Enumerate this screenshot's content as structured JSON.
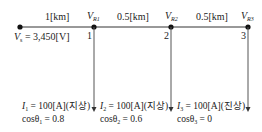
{
  "segments": [
    {
      "label": "1[km]"
    },
    {
      "label": "0.5[km]"
    },
    {
      "label": "0.5[km]"
    }
  ],
  "source": {
    "label_symbol": "V",
    "label_sub": "s",
    "label_value": " = 3,450[V]"
  },
  "nodes": [
    {
      "number": "1",
      "v_symbol": "V",
      "v_sub": "R1"
    },
    {
      "number": "2",
      "v_symbol": "V",
      "v_sub": "R2"
    },
    {
      "number": "3",
      "v_symbol": "V",
      "v_sub": "R3"
    }
  ],
  "loads": [
    {
      "current_symbol": "I",
      "current_sub": "1",
      "current_value": " = 100[A](지상)",
      "pf_label": "cosθ",
      "pf_sub": "1",
      "pf_value": " = 0.8"
    },
    {
      "current_symbol": "I",
      "current_sub": "2",
      "current_value": " = 100[A](지상)",
      "pf_label": "cosθ",
      "pf_sub": "2",
      "pf_value": " = 0.6"
    },
    {
      "current_symbol": "I",
      "current_sub": "3",
      "current_value": " = 100[A](진상)",
      "pf_label": "cosθ",
      "pf_sub": "3",
      "pf_value": " = 0"
    }
  ]
}
